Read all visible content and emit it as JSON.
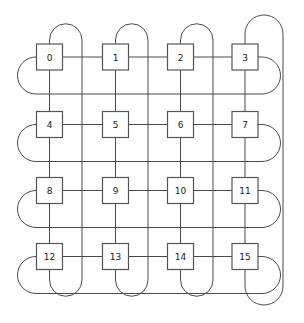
{
  "diagram": {
    "type": "torus-network",
    "rows": 4,
    "cols": 4,
    "background_color": "#ffffff",
    "line_color": "#4a4a4a",
    "node_fill": "#ffffff",
    "node_stroke": "#555555",
    "nodes": [
      {
        "id": "0",
        "label": "0",
        "row": 0,
        "col": 0,
        "cx": 49.5,
        "cy": 57.0
      },
      {
        "id": "1",
        "label": "1",
        "row": 0,
        "col": 1,
        "cx": 115.5,
        "cy": 57.0
      },
      {
        "id": "2",
        "label": "2",
        "row": 0,
        "col": 2,
        "cx": 180.5,
        "cy": 57.0
      },
      {
        "id": "3",
        "label": "3",
        "row": 0,
        "col": 3,
        "cx": 245.0,
        "cy": 57.0
      },
      {
        "id": "4",
        "label": "4",
        "row": 1,
        "col": 0,
        "cx": 49.5,
        "cy": 124.5
      },
      {
        "id": "5",
        "label": "5",
        "row": 1,
        "col": 1,
        "cx": 115.5,
        "cy": 124.5
      },
      {
        "id": "6",
        "label": "6",
        "row": 1,
        "col": 2,
        "cx": 180.5,
        "cy": 124.5
      },
      {
        "id": "7",
        "label": "7",
        "row": 1,
        "col": 3,
        "cx": 245.0,
        "cy": 124.5
      },
      {
        "id": "8",
        "label": "8",
        "row": 2,
        "col": 0,
        "cx": 49.5,
        "cy": 190.5
      },
      {
        "id": "9",
        "label": "9",
        "row": 2,
        "col": 1,
        "cx": 115.5,
        "cy": 190.5
      },
      {
        "id": "10",
        "label": "10",
        "row": 2,
        "col": 2,
        "cx": 180.5,
        "cy": 190.5
      },
      {
        "id": "11",
        "label": "11",
        "row": 2,
        "col": 3,
        "cx": 245.0,
        "cy": 190.5
      },
      {
        "id": "12",
        "label": "12",
        "row": 3,
        "col": 0,
        "cx": 49.5,
        "cy": 256.5
      },
      {
        "id": "13",
        "label": "13",
        "row": 3,
        "col": 1,
        "cx": 115.5,
        "cy": 256.5
      },
      {
        "id": "14",
        "label": "14",
        "row": 3,
        "col": 2,
        "cx": 180.5,
        "cy": 256.5
      },
      {
        "id": "15",
        "label": "15",
        "row": 3,
        "col": 3,
        "cx": 245.0,
        "cy": 256.5
      }
    ],
    "node_size": {
      "w": 26,
      "h": 26
    },
    "geometry": {
      "node_half": 13,
      "row_centers": [
        57.0,
        124.5,
        190.5,
        256.5
      ],
      "col_centers": [
        49.5,
        115.5,
        180.5,
        245.0
      ],
      "vertical_wrap_x": [
        82.0,
        147.0,
        212.0,
        283.0
      ],
      "horizontal_wrap_y": [
        94.0,
        160.0,
        226.0,
        292.0
      ],
      "left_wrap_x": 18.0,
      "right_wrap_x": 272.0,
      "top_wrap_y": 22.0,
      "bottom_wrap_y": 300.0
    },
    "edges_mesh_horizontal": [
      [
        "0",
        "1"
      ],
      [
        "1",
        "2"
      ],
      [
        "2",
        "3"
      ],
      [
        "4",
        "5"
      ],
      [
        "5",
        "6"
      ],
      [
        "6",
        "7"
      ],
      [
        "8",
        "9"
      ],
      [
        "9",
        "10"
      ],
      [
        "10",
        "11"
      ],
      [
        "12",
        "13"
      ],
      [
        "13",
        "14"
      ],
      [
        "14",
        "15"
      ]
    ],
    "edges_mesh_vertical": [
      [
        "0",
        "4"
      ],
      [
        "4",
        "8"
      ],
      [
        "8",
        "12"
      ],
      [
        "1",
        "5"
      ],
      [
        "5",
        "9"
      ],
      [
        "9",
        "13"
      ],
      [
        "2",
        "6"
      ],
      [
        "6",
        "10"
      ],
      [
        "10",
        "14"
      ],
      [
        "3",
        "7"
      ],
      [
        "7",
        "11"
      ],
      [
        "11",
        "15"
      ]
    ],
    "edges_wraparound_horizontal": [
      [
        "3",
        "0"
      ],
      [
        "7",
        "4"
      ],
      [
        "11",
        "8"
      ],
      [
        "15",
        "12"
      ]
    ],
    "edges_wraparound_vertical": [
      [
        "12",
        "0"
      ],
      [
        "13",
        "1"
      ],
      [
        "14",
        "2"
      ],
      [
        "15",
        "3"
      ]
    ]
  }
}
